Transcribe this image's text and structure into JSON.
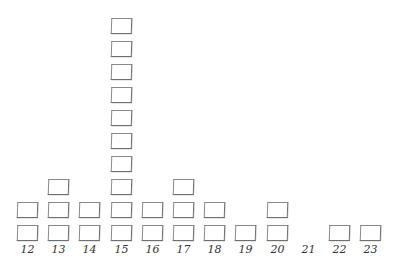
{
  "chart_data": {
    "type": "dot-plot",
    "title": "",
    "xlabel": "",
    "ylabel": "",
    "marker": "square",
    "categories": [
      "12",
      "13",
      "14",
      "15",
      "16",
      "17",
      "18",
      "19",
      "20",
      "21",
      "22",
      "23"
    ],
    "values": [
      2,
      3,
      2,
      10,
      2,
      3,
      2,
      1,
      2,
      0,
      1,
      1
    ],
    "grid": false,
    "legend": null
  },
  "colors": {
    "box_border": "#8a8a8a",
    "label": "#333333",
    "background": "#ffffff"
  }
}
